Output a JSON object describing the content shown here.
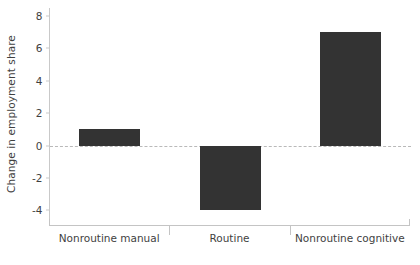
{
  "chart_data": {
    "type": "bar",
    "title": "",
    "subtitle": "",
    "xlabel": "",
    "ylabel": "Change in employment share",
    "categories": [
      "Nonroutine manual",
      "Routine",
      "Nonroutine cognitive"
    ],
    "values": [
      1,
      -4,
      7
    ],
    "series": [
      {
        "name": "Change in employment share",
        "values": [
          1,
          -4,
          7
        ]
      }
    ],
    "ylim": [
      -4.9,
      8.5
    ],
    "yticks": [
      8,
      6,
      4,
      2,
      0,
      -2,
      -4
    ],
    "ytick_labels": [
      "8",
      "6",
      "4",
      "2",
      "0",
      "-2",
      "-4"
    ],
    "grid": false,
    "legend": false,
    "legend_position": "none",
    "zero_reference_line": true,
    "bar_color": "#333333",
    "axis_color": "#c4c4c4",
    "zero_line_color": "#b9b9b9",
    "text_color": "#3f3f3f",
    "background_color": "#ffffff"
  }
}
